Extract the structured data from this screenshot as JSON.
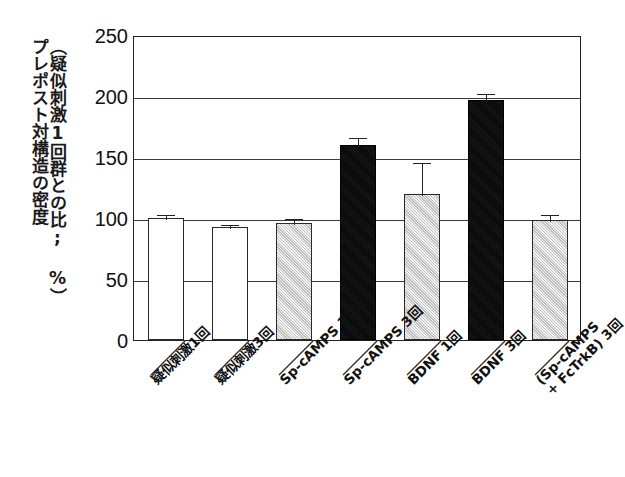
{
  "chart_data": {
    "type": "bar",
    "title": "",
    "xlabel": "",
    "ylabel": "プレポスト対構造の密度\n（疑似刺激1回群との比; %）",
    "ylabel_line1": "プレポスト対構造の密度",
    "ylabel_line2": "（疑似刺激1回群との比; %）",
    "ylim": [
      0,
      250
    ],
    "yticks": [
      0,
      50,
      100,
      150,
      200,
      250
    ],
    "ytick_labels": [
      "0",
      "50",
      "100",
      "150",
      "200",
      "250"
    ],
    "grid": true,
    "legend": "none",
    "categories": [
      "疑似刺激1回",
      "疑似刺激3回",
      "Sp-cAMPS 1回",
      "Sp-cAMPS 3回",
      "BDNF 1回",
      "BDNF 3回",
      "(Sp-cAMPS + FcTrkB) 3回"
    ],
    "values": [
      100,
      93,
      96,
      160,
      120,
      197,
      98
    ],
    "errors": [
      4,
      3,
      5,
      7,
      27,
      6,
      6
    ],
    "fills": [
      "white",
      "white",
      "gray",
      "black",
      "gray",
      "black",
      "gray"
    ],
    "colors": {
      "white_bar": "#ffffff",
      "gray_bar": "#d3d3d3",
      "black_bar": "#0c0c0c",
      "outline": "#2a2a2a",
      "gridline": "#3a3a3a",
      "text": "#111111"
    },
    "bars": [
      {
        "label": "疑似刺激1回",
        "label_line1": "疑似刺激1回",
        "label_line2": "",
        "value": 100,
        "error": 4,
        "fill": "white"
      },
      {
        "label": "疑似刺激3回",
        "label_line1": "疑似刺激3回",
        "label_line2": "",
        "value": 93,
        "error": 3,
        "fill": "white"
      },
      {
        "label": "Sp-cAMPS 1回",
        "label_line1": "Sp-cAMPS 1回",
        "label_line2": "",
        "value": 96,
        "error": 5,
        "fill": "gray"
      },
      {
        "label": "Sp-cAMPS 3回",
        "label_line1": "Sp-cAMPS 3回",
        "label_line2": "",
        "value": 160,
        "error": 7,
        "fill": "black"
      },
      {
        "label": "BDNF 1回",
        "label_line1": "BDNF 1回",
        "label_line2": "",
        "value": 120,
        "error": 27,
        "fill": "gray"
      },
      {
        "label": "BDNF 3回",
        "label_line1": "BDNF 3回",
        "label_line2": "",
        "value": 197,
        "error": 6,
        "fill": "black"
      },
      {
        "label": "(Sp-cAMPS + FcTrkB) 3回",
        "label_line1": "(Sp-cAMPS",
        "label_line2": "+ FcTrkB) 3回",
        "value": 98,
        "error": 6,
        "fill": "gray"
      }
    ]
  }
}
